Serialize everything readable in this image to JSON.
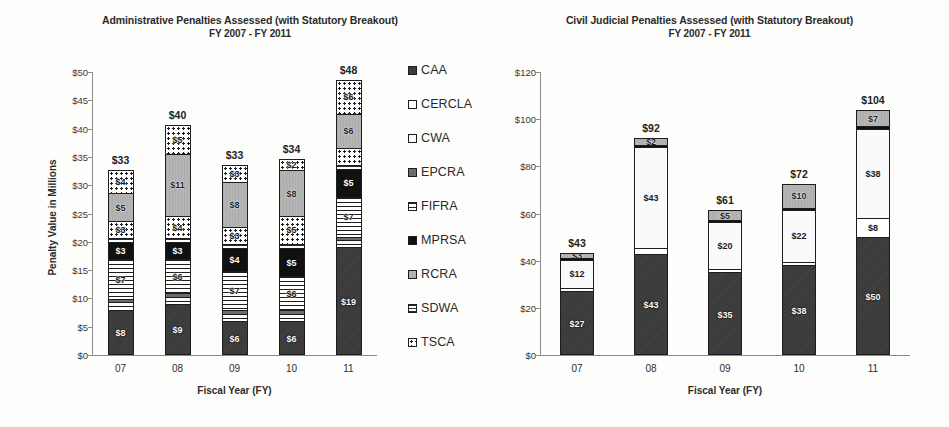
{
  "legend": {
    "position": "right-of-left-chart",
    "entries": [
      {
        "key": "CAA",
        "label": "CAA"
      },
      {
        "key": "CERCLA",
        "label": "CERCLA"
      },
      {
        "key": "CWA",
        "label": "CWA"
      },
      {
        "key": "EPCRA",
        "label": "EPCRA"
      },
      {
        "key": "FIFRA",
        "label": "FIFRA"
      },
      {
        "key": "MPRSA",
        "label": "MPRSA"
      },
      {
        "key": "RCRA",
        "label": "RCRA"
      },
      {
        "key": "SDWA",
        "label": "SDWA"
      },
      {
        "key": "TSCA",
        "label": "TSCA"
      }
    ]
  },
  "chart_data": [
    {
      "id": "administrative",
      "type": "bar",
      "stacked": true,
      "title": "Administrative Penalties Assessed (with Statutory Breakout)",
      "subtitle": "FY 2007 - FY 2011",
      "xlabel": "Fiscal Year (FY)",
      "ylabel": "Penalty Value in Millions",
      "categories": [
        "07",
        "08",
        "09",
        "10",
        "11"
      ],
      "ylim": [
        0,
        50
      ],
      "ytick_step": 5,
      "ytick_labels": [
        "$0",
        "$5",
        "$10",
        "$15",
        "$20",
        "$25",
        "$30",
        "$35",
        "$40",
        "$45",
        "$50"
      ],
      "grid": false,
      "totals": [
        "$33",
        "$40",
        "$33",
        "$34",
        "$48"
      ],
      "total_values": [
        33,
        40,
        33,
        34,
        48
      ],
      "series": [
        {
          "name": "CAA",
          "values": [
            8,
            9,
            6,
            6,
            19
          ],
          "labels": [
            "$8",
            "$9",
            "$6",
            "$6",
            "$19"
          ]
        },
        {
          "name": "CERCLA",
          "values": [
            0.6,
            0.6,
            0.6,
            0.6,
            0.6
          ],
          "labels": [
            "",
            "",
            "",
            "",
            ""
          ]
        },
        {
          "name": "CWA",
          "values": [
            0.7,
            0.7,
            0.7,
            0.7,
            0.7
          ],
          "labels": [
            "",
            "",
            "",
            "",
            ""
          ]
        },
        {
          "name": "EPCRA",
          "values": [
            0.6,
            0.6,
            0.6,
            0.6,
            0.6
          ],
          "labels": [
            "",
            "",
            "",
            "",
            ""
          ]
        },
        {
          "name": "FIFRA",
          "values": [
            7,
            6,
            7,
            6,
            7
          ],
          "labels": [
            "$7",
            "$6",
            "$7",
            "$6",
            "$7"
          ]
        },
        {
          "name": "MPRSA",
          "values": [
            3,
            3,
            4,
            5,
            5
          ],
          "labels": [
            "$3",
            "$3",
            "$4",
            "$5",
            "$5"
          ]
        },
        {
          "name": "SDWA",
          "values": [
            0.7,
            0.7,
            0.7,
            0.7,
            0.7
          ],
          "labels": [
            "",
            "",
            "",
            "",
            ""
          ]
        },
        {
          "name": "TSCA",
          "values": [
            3,
            4,
            3,
            5,
            3
          ],
          "labels": [
            "$3",
            "$4",
            "$3",
            "$5",
            ""
          ]
        },
        {
          "name": "RCRA",
          "values": [
            5,
            11,
            8,
            8,
            6
          ],
          "labels": [
            "$5",
            "$11",
            "$8",
            "$8",
            "$6"
          ]
        },
        {
          "name": "TSCA2",
          "values": [
            4,
            5,
            3,
            2,
            6
          ],
          "labels": [
            "$4",
            "$5",
            "$3",
            "$2",
            "$6"
          ]
        }
      ]
    },
    {
      "id": "civil-judicial",
      "type": "bar",
      "stacked": true,
      "title": "Civil Judicial Penalties Assessed (with Statutory Breakout)",
      "subtitle": "FY 2007 - FY 2011",
      "xlabel": "Fiscal Year (FY)",
      "ylabel": "",
      "categories": [
        "07",
        "08",
        "09",
        "10",
        "11"
      ],
      "ylim": [
        0,
        120
      ],
      "ytick_step": 20,
      "ytick_labels": [
        "$0",
        "$20",
        "$40",
        "$60",
        "$80",
        "$100",
        "$120"
      ],
      "grid": false,
      "totals": [
        "$43",
        "$92",
        "$61",
        "$72",
        "$104"
      ],
      "total_values": [
        43,
        92,
        61,
        72,
        104
      ],
      "series": [
        {
          "name": "CAA",
          "values": [
            27,
            43,
            35,
            38,
            50
          ],
          "labels": [
            "$27",
            "$43",
            "$35",
            "$38",
            "$50"
          ]
        },
        {
          "name": "CERCLA",
          "values": [
            1.4,
            2.2,
            1.4,
            1.6,
            8
          ],
          "labels": [
            "",
            "",
            "",
            "",
            "$8"
          ]
        },
        {
          "name": "CWA",
          "values": [
            12,
            43,
            20,
            22,
            38
          ],
          "labels": [
            "$12",
            "$43",
            "$20",
            "$22",
            "$38"
          ]
        },
        {
          "name": "MPRSA",
          "values": [
            0.9,
            0.9,
            0.9,
            0.9,
            0.9
          ],
          "labels": [
            "",
            "",
            "",
            "",
            ""
          ]
        },
        {
          "name": "RCRA",
          "values": [
            2,
            3,
            4,
            10,
            7
          ],
          "labels": [
            "$3",
            "$2",
            "$5",
            "$10",
            "$7"
          ]
        }
      ]
    }
  ]
}
